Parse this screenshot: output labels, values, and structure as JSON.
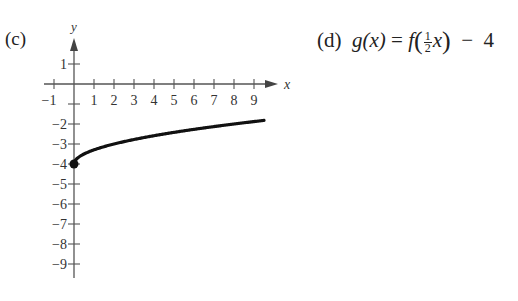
{
  "panels": {
    "c": {
      "label": "(c)"
    },
    "d": {
      "label": "(d)",
      "lhs": "g(x)",
      "equals": "=",
      "f": "f",
      "frac_num": "1",
      "frac_den": "2",
      "var": "x",
      "minus": "−",
      "const": "4"
    }
  },
  "chart_data": {
    "type": "line",
    "title": "(c)",
    "function": "g(x) = sqrt(x/2) - 4",
    "xlabel": "x",
    "ylabel": "y",
    "xlim": [
      -1.5,
      10.1
    ],
    "ylim": [
      -9.7,
      2.2
    ],
    "x_ticks": [
      -1,
      1,
      2,
      3,
      4,
      5,
      6,
      7,
      8,
      9
    ],
    "x_tick_labels": [
      "−1",
      "1",
      "2",
      "3",
      "4",
      "5",
      "6",
      "7",
      "8",
      "9"
    ],
    "y_ticks": [
      1,
      -1,
      -2,
      -3,
      -4,
      -5,
      -6,
      -7,
      -8,
      -9
    ],
    "y_tick_labels": [
      "1",
      "",
      "−2",
      "−3",
      "−4",
      "−5",
      "−6",
      "−7",
      "−8",
      "−9"
    ],
    "grid": false,
    "series": [
      {
        "name": "curve",
        "x": [
          0,
          0.1,
          0.25,
          0.5,
          1,
          1.5,
          2,
          3,
          4,
          5,
          6,
          7,
          8,
          9,
          9.5
        ],
        "y": [
          -4,
          -3.78,
          -3.65,
          -3.5,
          -3.29,
          -3.13,
          -3,
          -2.78,
          -2.59,
          -2.42,
          -2.27,
          -2.13,
          -2,
          -1.88,
          -1.82
        ],
        "endpoint": {
          "x": 0,
          "y": -4,
          "style": "closed-dot"
        }
      }
    ]
  }
}
